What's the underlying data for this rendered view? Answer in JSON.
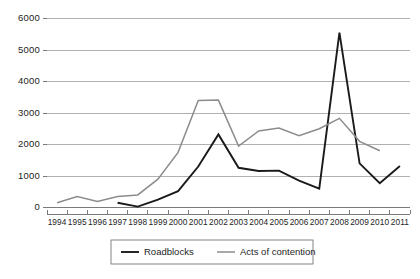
{
  "chart_data": {
    "type": "line",
    "title": "",
    "xlabel": "",
    "ylabel": "",
    "x": [
      1994,
      1995,
      1996,
      1997,
      1998,
      1999,
      2000,
      2001,
      2002,
      2003,
      2004,
      2005,
      2006,
      2007,
      2008,
      2009,
      2010,
      2011
    ],
    "categories": [
      "1994",
      "1995",
      "1996",
      "1997",
      "1998",
      "1999",
      "2000",
      "2001",
      "2002",
      "2003",
      "2004",
      "2005",
      "2006",
      "2007",
      "2008",
      "2009",
      "2010",
      "2011"
    ],
    "series": [
      {
        "name": "Roadblocks",
        "color": "#1a1a1a",
        "stroke_width": 1.9,
        "values": [
          null,
          null,
          null,
          150,
          30,
          250,
          520,
          1300,
          2320,
          1260,
          1160,
          1170,
          850,
          600,
          5550,
          1400,
          770,
          1320
        ]
      },
      {
        "name": "Acts of contention",
        "color": "#8c8c8c",
        "stroke_width": 1.5,
        "values": [
          150,
          350,
          190,
          350,
          400,
          900,
          1750,
          3400,
          3410,
          1950,
          2430,
          2520,
          2280,
          2500,
          2830,
          2100,
          1800,
          null
        ]
      }
    ],
    "ylim": [
      0,
      6000
    ],
    "yticks": [
      0,
      1000,
      2000,
      3000,
      4000,
      5000,
      6000
    ],
    "ytick_labels": [
      "0",
      "1000",
      "2000",
      "3000",
      "4000",
      "5000",
      "6000"
    ],
    "grid": true,
    "grid_axis": "y",
    "legend_position": "bottom-center",
    "legend_entries": [
      "Roadblocks",
      "Acts of contention"
    ],
    "background_color": "#ffffff",
    "grid_color": "#a8a8a8",
    "axis_color": "#6d6d6d"
  }
}
